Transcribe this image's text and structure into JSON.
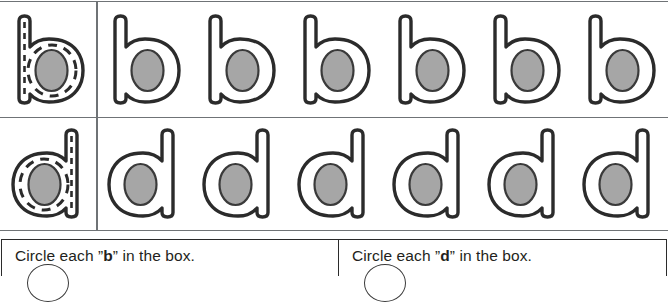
{
  "worksheet": {
    "type": "letter-tracing-and-circling",
    "colors": {
      "grid_line": "#6f7376",
      "panel_border": "#2b2b2b",
      "letter_outline": "#2b2b2b",
      "letter_counter_fill": "#a6a6a6",
      "text": "#231f20",
      "background": "#ffffff"
    }
  },
  "practice_grid": {
    "rows": [
      {
        "id": "row-b",
        "letter": "b",
        "model": {
          "letter": "b",
          "style": "dashed-trace",
          "data_name": "model-letter-b"
        },
        "practice_count": 6,
        "practice": [
          {
            "letter": "b",
            "style": "outline"
          },
          {
            "letter": "b",
            "style": "outline"
          },
          {
            "letter": "b",
            "style": "outline"
          },
          {
            "letter": "b",
            "style": "outline"
          },
          {
            "letter": "b",
            "style": "outline"
          },
          {
            "letter": "b",
            "style": "outline"
          }
        ]
      },
      {
        "id": "row-d",
        "letter": "d",
        "model": {
          "letter": "d",
          "style": "dashed-trace",
          "data_name": "model-letter-d"
        },
        "practice_count": 6,
        "practice": [
          {
            "letter": "d",
            "style": "outline"
          },
          {
            "letter": "d",
            "style": "outline"
          },
          {
            "letter": "d",
            "style": "outline"
          },
          {
            "letter": "d",
            "style": "outline"
          },
          {
            "letter": "d",
            "style": "outline"
          },
          {
            "letter": "d",
            "style": "outline"
          }
        ]
      }
    ]
  },
  "instructions": {
    "left": {
      "prefix": "Circle each ",
      "open_quote": "”",
      "letter": "b",
      "close_quote": "”",
      "suffix": " in the box.",
      "full_text": "Circle each ”b” in the box."
    },
    "right": {
      "prefix": "Circle each ",
      "open_quote": "”",
      "letter": "d",
      "close_quote": "”",
      "suffix": " in the box.",
      "full_text": "Circle each ”d” in the box."
    }
  }
}
